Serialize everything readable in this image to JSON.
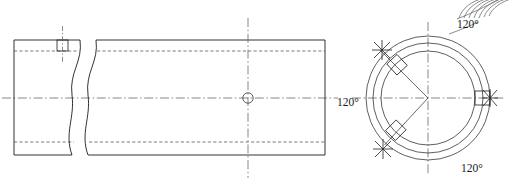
{
  "drawing": {
    "title": "Pipe longitudinal section and end cross-section",
    "background_color": "#ffffff",
    "line_color": "#1c1c1c",
    "hidden_line_color": "#444444",
    "center_line_color": "#555555",
    "label_color": "#1a1a1a",
    "width": 519,
    "height": 186
  },
  "longitudinal_view": {
    "name": "pipe-side-view",
    "body": {
      "x": 14,
      "y": 40,
      "width": 311,
      "height": 115
    },
    "break_line": {
      "x_start": 74,
      "x_end": 96
    },
    "hidden_lines_y": [
      51,
      142
    ],
    "center_line_y": 98,
    "top_slot": {
      "x": 57,
      "y": 40,
      "width": 11,
      "height": 11
    },
    "hole": {
      "cx": 248,
      "cy": 98,
      "r": 5.2
    },
    "hole_center_line_x": 248
  },
  "cross_section_view": {
    "name": "pipe-end-view",
    "center": {
      "cx": 428,
      "cy": 98
    },
    "circles": [
      {
        "name": "outer-circle",
        "r": 62
      },
      {
        "name": "middle-circle",
        "r": 55
      },
      {
        "name": "inner-circle",
        "r": 47
      }
    ],
    "slot_angles_deg": [
      0,
      120,
      240
    ],
    "slot_count": 3,
    "radial_lines_deg": [
      120,
      240
    ],
    "star_markers": 3
  },
  "labels": {
    "angle_top": "120°",
    "angle_left": "120°",
    "angle_bottom": "120°"
  },
  "knurl_detail": {
    "name": "knurl-hatch-arcs",
    "arc_count": 7,
    "color": "#707070"
  }
}
